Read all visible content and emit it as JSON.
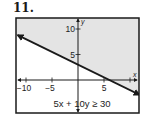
{
  "problem": {
    "number": "11."
  },
  "chart_data": {
    "type": "line",
    "title": "",
    "inequality": "5x + 10y ≥ 30",
    "boundary": {
      "equation": "5x + 10y = 30",
      "slope": -0.5,
      "intercept": 3,
      "style": "solid"
    },
    "shading": "above",
    "shade_color": "#e4e4e4",
    "line_color": "#1a1a1a",
    "xlabel": "x",
    "ylabel": "y",
    "xlim": [
      -12,
      12
    ],
    "ylim": [
      -6.5,
      12
    ],
    "x_ticks": [
      -10,
      -5,
      5,
      10
    ],
    "x_tick_labels": [
      "−10",
      "−5",
      "5",
      ""
    ],
    "y_ticks": [
      5,
      10
    ],
    "y_tick_labels": [
      "5",
      "10"
    ],
    "grid": false
  }
}
